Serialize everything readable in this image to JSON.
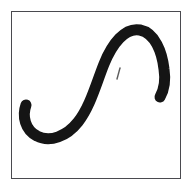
{
  "canvas": {
    "width": 194,
    "height": 191,
    "background_color": "#ffffff",
    "border_color": "#4a4a4f",
    "ink_color": "#151515",
    "tick_color": "#5c5c5c",
    "label": "handwritten stroke panel",
    "caption_text": ""
  },
  "drawing": {
    "name": "integral-like-s-stroke",
    "description": "thick black hand-drawn stroke resembling an integral sign or cursive S",
    "stroke_width": 11,
    "strokes": [
      {
        "name": "main-s-stroke",
        "path": "M 14 93 C 10 104, 13 118, 25 124 C 38 131, 55 124, 66 110 C 78 95, 84 72, 92 52 C 100 32, 113 15, 128 18 C 143 21, 150 40, 152 57 C 154 70, 152 78, 148 85",
        "width": 11
      }
    ],
    "marks": [
      {
        "name": "small-diagonal-tick",
        "path": "M 108 56 L 105 67",
        "width": 1.4
      }
    ]
  }
}
